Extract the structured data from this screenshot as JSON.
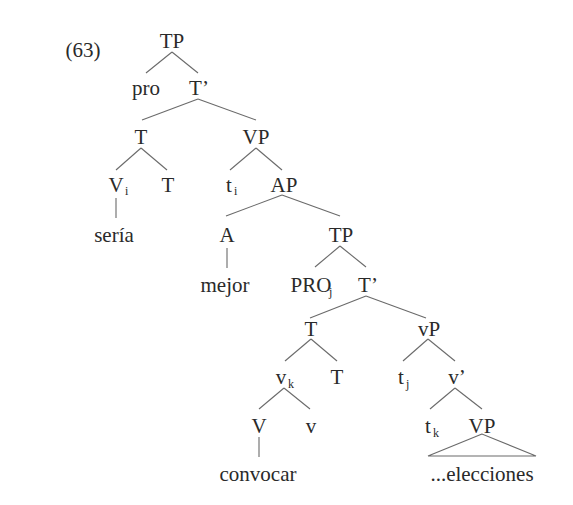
{
  "example_number": "(63)",
  "nodes": {
    "tp_root": {
      "label": "TP"
    },
    "pro": {
      "label": "pro"
    },
    "tbar_1": {
      "label": "T’"
    },
    "t_1": {
      "label": "T"
    },
    "vp_1": {
      "label": "VP"
    },
    "v_i": {
      "label": "V",
      "sub": "i"
    },
    "t_2": {
      "label": "T"
    },
    "t_i": {
      "label": "t",
      "sub": "i"
    },
    "ap": {
      "label": "AP"
    },
    "seria": {
      "label": "sería"
    },
    "a": {
      "label": "A"
    },
    "tp_2": {
      "label": "TP"
    },
    "mejor": {
      "label": "mejor"
    },
    "pro_j": {
      "label": "PRO",
      "sub": "j"
    },
    "tbar_2": {
      "label": "T’"
    },
    "t_3": {
      "label": "T"
    },
    "little_vp": {
      "label": "vP"
    },
    "v_k": {
      "label": "v",
      "sub": "k"
    },
    "t_4": {
      "label": "T"
    },
    "t_j": {
      "label": "t",
      "sub": "j"
    },
    "vbar": {
      "label": "v’"
    },
    "big_v": {
      "label": "V"
    },
    "little_v": {
      "label": "v"
    },
    "t_k": {
      "label": "t",
      "sub": "k"
    },
    "vp_2": {
      "label": "VP"
    },
    "convocar": {
      "label": "convocar"
    },
    "elecciones": {
      "label": "...elecciones"
    }
  }
}
